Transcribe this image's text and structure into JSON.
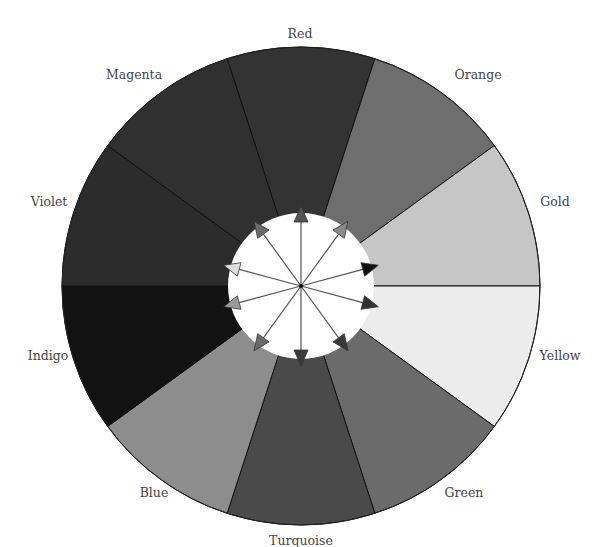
{
  "diagram": {
    "type": "color-wheel",
    "center": [
      301,
      286
    ],
    "outer_radius": 239,
    "inner_radius": 73,
    "segments": [
      {
        "label": "Red",
        "fill": "#333333",
        "label_pos": [
          300,
          38
        ]
      },
      {
        "label": "Orange",
        "fill": "#6e6e6e",
        "label_pos": [
          478,
          79
        ]
      },
      {
        "label": "Gold",
        "fill": "#c6c6c6",
        "label_pos": [
          555,
          206
        ]
      },
      {
        "label": "Yellow",
        "fill": "#ececec",
        "label_pos": [
          560,
          360
        ]
      },
      {
        "label": "Green",
        "fill": "#6b6b6b",
        "label_pos": [
          464,
          497
        ]
      },
      {
        "label": "Turquoise",
        "fill": "#4a4a4a",
        "label_pos": [
          301,
          545
        ]
      },
      {
        "label": "Blue",
        "fill": "#8d8d8d",
        "label_pos": [
          154,
          497
        ]
      },
      {
        "label": "Indigo",
        "fill": "#121212",
        "label_pos": [
          48,
          360
        ]
      },
      {
        "label": "Violet",
        "fill": "#2c2c2c",
        "label_pos": [
          49,
          206
        ]
      },
      {
        "label": "Magenta",
        "fill": "#303030",
        "label_pos": [
          134,
          79
        ]
      }
    ],
    "arrows": [
      {
        "angle_deg": 90,
        "fill": "#555555"
      },
      {
        "angle_deg": 54,
        "fill": "#8a8a8a"
      },
      {
        "angle_deg": 15,
        "fill": "#111111"
      },
      {
        "angle_deg": -15,
        "fill": "#333333"
      },
      {
        "angle_deg": -54,
        "fill": "#3a3a3a"
      },
      {
        "angle_deg": -90,
        "fill": "#3a3a3a"
      },
      {
        "angle_deg": -126,
        "fill": "#6a6a6a"
      },
      {
        "angle_deg": -165,
        "fill": "#9a9a9a"
      },
      {
        "angle_deg": 165,
        "fill": "#dedede"
      },
      {
        "angle_deg": 126,
        "fill": "#6a6a6a"
      }
    ],
    "colors": {
      "background": "#ffffff",
      "inner_circle": "#ffffff",
      "divider": "#111111",
      "spoke": "#555555",
      "label_text": "#444444"
    }
  }
}
